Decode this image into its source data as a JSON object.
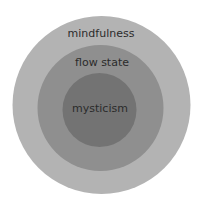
{
  "diagram": {
    "type": "nested-circles",
    "layers": [
      {
        "label": "mindfulness",
        "color": "#b3b3b3"
      },
      {
        "label": "flow state",
        "color": "#8f8f8f"
      },
      {
        "label": "mysticism",
        "color": "#737373"
      }
    ]
  }
}
